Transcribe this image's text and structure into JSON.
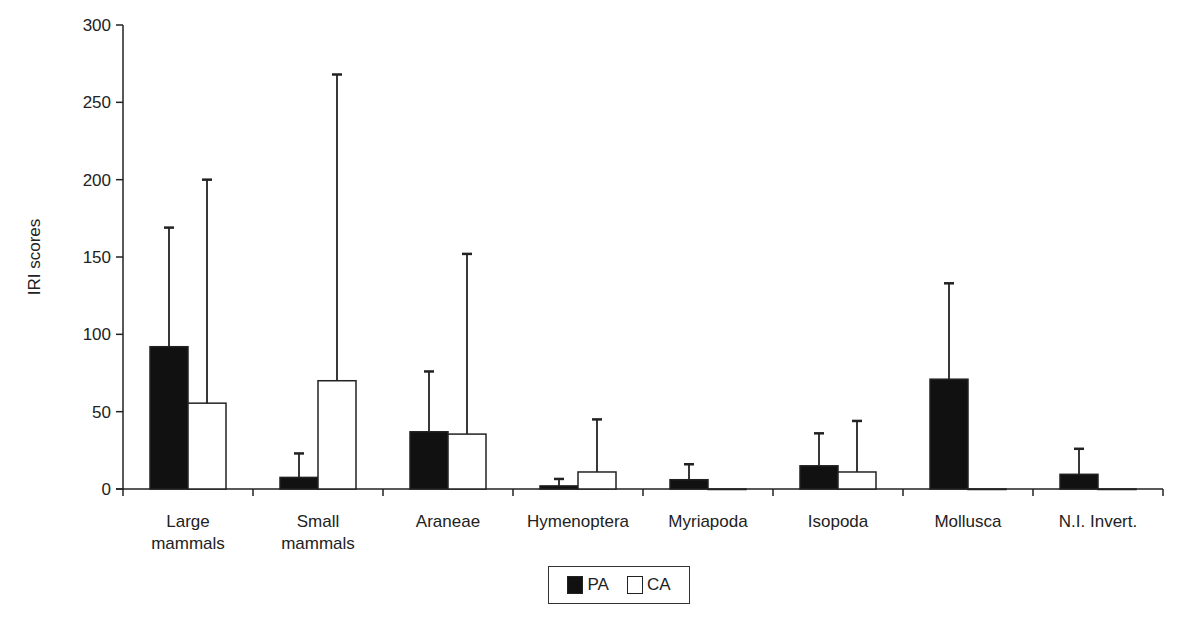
{
  "chart_data": {
    "type": "bar",
    "title": "",
    "xlabel": "",
    "ylabel": "IRI scores",
    "ylim": [
      0,
      300
    ],
    "yticks": [
      0,
      50,
      100,
      150,
      200,
      250,
      300
    ],
    "grid": false,
    "legend_position": "bottom-center",
    "categories": [
      [
        "Large",
        "mammals"
      ],
      [
        "Small",
        "mammals"
      ],
      [
        "Araneae"
      ],
      [
        "Hymenoptera"
      ],
      [
        "Myriapoda"
      ],
      [
        "Isopoda"
      ],
      [
        "Mollusca"
      ],
      [
        "N.I. Invert."
      ]
    ],
    "series": [
      {
        "name": "PA",
        "fill": "#111111",
        "values": [
          92,
          7.5,
          37,
          2,
          6,
          15,
          71,
          9.5
        ],
        "error_upper": [
          169,
          23,
          76,
          6.5,
          16,
          36,
          133,
          26
        ]
      },
      {
        "name": "CA",
        "fill": "#ffffff",
        "values": [
          55.5,
          70,
          35.5,
          11,
          0,
          11,
          0,
          0
        ],
        "error_upper": [
          200,
          268,
          152,
          45,
          null,
          44,
          null,
          null
        ]
      }
    ]
  },
  "legend": {
    "items": [
      {
        "label": "PA",
        "swatch": "filled-black"
      },
      {
        "label": "CA",
        "swatch": "hollow-white"
      }
    ]
  }
}
